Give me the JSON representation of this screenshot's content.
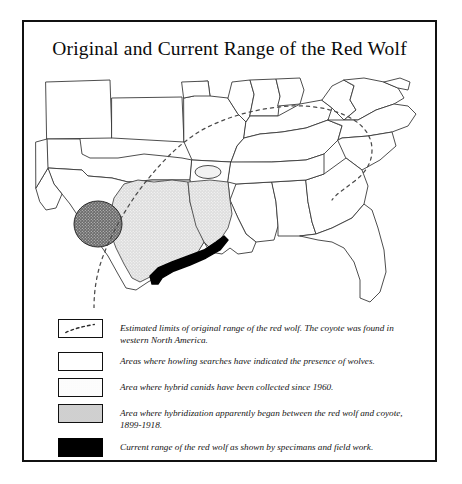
{
  "figure": {
    "title": "Original and Current Range of the Red Wolf"
  },
  "legend": {
    "items": [
      {
        "swatch": "dashed-line-swatch",
        "text": "Estimated limits of original range of the red wolf. The coyote was found in western North America."
      },
      {
        "swatch": "white-area-swatch",
        "text": "Areas where howling searches have indicated the presence of wolves."
      },
      {
        "swatch": "light-stipple-swatch",
        "text": "Area where hybrid canids have been collected since 1960."
      },
      {
        "swatch": "dark-stipple-swatch",
        "text": "Area where hybridization apparently began between the red wolf and coyote, 1899-1918."
      },
      {
        "swatch": "solid-black-swatch",
        "text": "Current range of the red wolf as shown by specimans and field work."
      }
    ]
  },
  "map": {
    "description": "Outline map of the central and southeastern United States showing state boundaries, a dashed boundary marking the estimated limits of the original red wolf range, shaded hybrid-canid areas in east Texas and Louisiana, a darker stippled hybridization-origin area in central-east Texas, a small white howling-search ellipse in Arkansas, and a solid black current range along the Texas-Louisiana Gulf coast.",
    "colors": {
      "outline": "#3a3a3a",
      "frame": "#111111",
      "light_stipple": "#d9d9d9",
      "dark_stipple": "#6f6f6f",
      "current_range": "#000000",
      "background": "#ffffff"
    }
  }
}
